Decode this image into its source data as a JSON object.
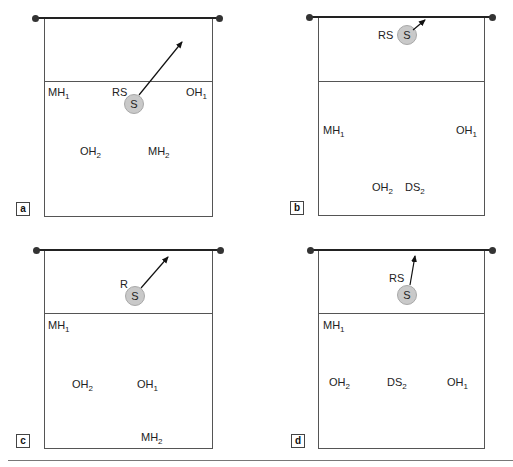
{
  "figure": {
    "panels": [
      {
        "id": "a",
        "label": "a",
        "ball": {
          "label": "S",
          "x": 134,
          "y": 104
        },
        "arrow": {
          "x1": 139,
          "y1": 95,
          "x2": 182,
          "y2": 42
        },
        "players": [
          {
            "base": "MH",
            "sub": "1",
            "x": 48,
            "y": 87
          },
          {
            "base": "RS",
            "sub": "",
            "x": 112,
            "y": 87
          },
          {
            "base": "OH",
            "sub": "1",
            "x": 186,
            "y": 87
          },
          {
            "base": "OH",
            "sub": "2",
            "x": 80,
            "y": 146
          },
          {
            "base": "MH",
            "sub": "2",
            "x": 148,
            "y": 146
          }
        ]
      },
      {
        "id": "b",
        "label": "b",
        "ball": {
          "label": "S",
          "x": 407,
          "y": 35
        },
        "arrow": {
          "x1": 413,
          "y1": 30,
          "x2": 425,
          "y2": 20
        },
        "players": [
          {
            "base": "RS",
            "sub": "",
            "x": 378,
            "y": 30
          },
          {
            "base": "MH",
            "sub": "1",
            "x": 323,
            "y": 125
          },
          {
            "base": "OH",
            "sub": "1",
            "x": 456,
            "y": 125
          },
          {
            "base": "OH",
            "sub": "2",
            "x": 372,
            "y": 182
          },
          {
            "base": "DS",
            "sub": "2",
            "x": 405,
            "y": 182
          }
        ]
      },
      {
        "id": "c",
        "label": "c",
        "ball": {
          "label": "S",
          "x": 135,
          "y": 296
        },
        "arrow": {
          "x1": 141,
          "y1": 288,
          "x2": 168,
          "y2": 257
        },
        "players": [
          {
            "base": "R",
            "sub": "",
            "x": 120,
            "y": 279
          },
          {
            "base": "MH",
            "sub": "1",
            "x": 48,
            "y": 320
          },
          {
            "base": "OH",
            "sub": "2",
            "x": 72,
            "y": 379
          },
          {
            "base": "OH",
            "sub": "1",
            "x": 137,
            "y": 379
          },
          {
            "base": "MH",
            "sub": "2",
            "x": 141,
            "y": 432
          }
        ]
      },
      {
        "id": "d",
        "label": "d",
        "ball": {
          "label": "S",
          "x": 407,
          "y": 295
        },
        "arrow": {
          "x1": 410,
          "y1": 285,
          "x2": 415,
          "y2": 256
        },
        "players": [
          {
            "base": "RS",
            "sub": "",
            "x": 389,
            "y": 273
          },
          {
            "base": "MH",
            "sub": "1",
            "x": 323,
            "y": 320
          },
          {
            "base": "OH",
            "sub": "2",
            "x": 329,
            "y": 377
          },
          {
            "base": "DS",
            "sub": "2",
            "x": 387,
            "y": 377
          },
          {
            "base": "OH",
            "sub": "1",
            "x": 447,
            "y": 377
          }
        ]
      }
    ],
    "geometry": {
      "a": {
        "net_y": 17,
        "post_l": 35,
        "post_r": 219,
        "court_l": 44,
        "court_r": 212,
        "attack_y": 81,
        "bottom": 216,
        "label_x": 16,
        "label_y": 202
      },
      "b": {
        "net_y": 16,
        "post_l": 309,
        "post_r": 492,
        "court_l": 318,
        "court_r": 484,
        "attack_y": 81,
        "bottom": 215,
        "label_x": 290,
        "label_y": 201
      },
      "c": {
        "net_y": 249,
        "post_l": 36,
        "post_r": 220,
        "court_l": 44,
        "court_r": 212,
        "attack_y": 313,
        "bottom": 448,
        "label_x": 16,
        "label_y": 434
      },
      "d": {
        "net_y": 249,
        "post_l": 310,
        "post_r": 492,
        "court_l": 318,
        "court_r": 484,
        "attack_y": 313,
        "bottom": 448,
        "label_x": 291,
        "label_y": 434
      }
    },
    "bottom_rule": {
      "y": 460,
      "x1": 8,
      "x2": 513
    }
  }
}
